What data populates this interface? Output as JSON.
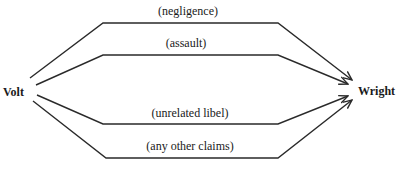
{
  "nodes": {
    "source": "Volt",
    "target": "Wright"
  },
  "edges": [
    {
      "label": "(negligence)"
    },
    {
      "label": "(assault)"
    },
    {
      "label": "(unrelated libel)"
    },
    {
      "label": "(any other claims)"
    }
  ],
  "colors": {
    "line": "#2a2a2a",
    "background": "#ffffff"
  }
}
